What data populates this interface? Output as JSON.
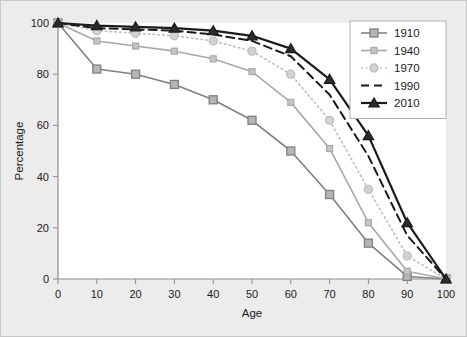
{
  "chart_data": {
    "type": "line",
    "title": "",
    "xlabel": "Age",
    "ylabel": "Percentage",
    "x": [
      0,
      10,
      20,
      30,
      40,
      50,
      60,
      70,
      80,
      90,
      100
    ],
    "xlim": [
      0,
      100
    ],
    "ylim": [
      0,
      100
    ],
    "xticks": [
      "0",
      "10",
      "20",
      "30",
      "40",
      "50",
      "60",
      "70",
      "80",
      "90",
      "100"
    ],
    "yticks": [
      "0",
      "20",
      "40",
      "60",
      "80",
      "100"
    ],
    "grid": false,
    "legend_position": "top-right",
    "series": [
      {
        "name": "1910",
        "values": [
          100,
          82,
          80,
          76,
          70,
          62,
          50,
          33,
          14,
          1,
          0
        ],
        "color": "#808080",
        "marker": "square",
        "dash": "none"
      },
      {
        "name": "1940",
        "values": [
          100,
          93,
          91,
          89,
          86,
          81,
          69,
          51,
          22,
          3,
          0
        ],
        "color": "#a8a8a8",
        "marker": "square-small",
        "dash": "none"
      },
      {
        "name": "1970",
        "values": [
          100,
          97,
          96,
          95,
          93,
          89,
          80,
          62,
          35,
          9,
          0
        ],
        "color": "#bdbdbd",
        "marker": "circle",
        "dash": "dotted"
      },
      {
        "name": "1990",
        "values": [
          100,
          98,
          97.5,
          97,
          95.5,
          93,
          87,
          72,
          48,
          17,
          0
        ],
        "color": "#1a1a1a",
        "marker": "none",
        "dash": "dashed"
      },
      {
        "name": "2010",
        "values": [
          100,
          99,
          98.5,
          98,
          97,
          95,
          90,
          78,
          56,
          22,
          0
        ],
        "color": "#1a1a1a",
        "marker": "triangle",
        "dash": "none"
      }
    ]
  }
}
